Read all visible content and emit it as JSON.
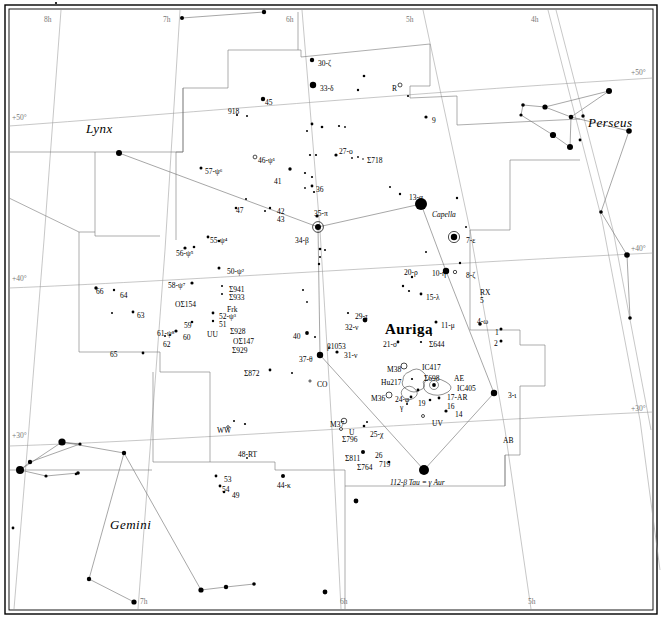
{
  "chart_data": {
    "type": "scatter",
    "xlabel": "Right Ascension",
    "ylabel": "Declination",
    "xlim": [
      "8h",
      "4h"
    ],
    "ylim": [
      "+28",
      "+56"
    ],
    "grid": true,
    "ra_ticks_top": [
      {
        "label": "8h",
        "x": 56
      },
      {
        "label": "7h",
        "x": 175
      },
      {
        "label": "6h",
        "x": 298
      },
      {
        "label": "5h",
        "x": 418
      },
      {
        "label": "4h",
        "x": 543
      }
    ],
    "ra_ticks_bottom": [
      {
        "label": "7h",
        "x": 140
      },
      {
        "label": "6h",
        "x": 340
      },
      {
        "label": "5h",
        "x": 528
      }
    ],
    "dec_ticks_left": [
      {
        "label": "+50°",
        "y": 122
      },
      {
        "label": "+40°",
        "y": 283
      },
      {
        "label": "+30°",
        "y": 440
      }
    ],
    "dec_ticks_right": [
      {
        "label": "+50°",
        "y": 77
      },
      {
        "label": "+40°",
        "y": 253
      },
      {
        "label": "+30°",
        "y": 413
      }
    ],
    "constellations": [
      {
        "name": "Lynx",
        "x": 86,
        "y": 122
      },
      {
        "name": "Perseus",
        "x": 588,
        "y": 116
      },
      {
        "name": "Auriga",
        "x": 385,
        "y": 322
      },
      {
        "name": "Gemini",
        "x": 110,
        "y": 518
      }
    ],
    "star_labels": [
      {
        "t": "30-ζ",
        "x": 318,
        "y": 60
      },
      {
        "t": "33-δ",
        "x": 320,
        "y": 85
      },
      {
        "t": "R",
        "x": 392,
        "y": 85
      },
      {
        "t": "45",
        "x": 265,
        "y": 99
      },
      {
        "t": "918",
        "x": 228,
        "y": 108
      },
      {
        "t": "9",
        "x": 432,
        "y": 117
      },
      {
        "t": "57-ψ⁶",
        "x": 205,
        "y": 168
      },
      {
        "t": "46-ψ¹",
        "x": 258,
        "y": 157
      },
      {
        "t": "27-o",
        "x": 339,
        "y": 148
      },
      {
        "t": "Σ718",
        "x": 367,
        "y": 157
      },
      {
        "t": "41",
        "x": 274,
        "y": 178
      },
      {
        "t": "36",
        "x": 316,
        "y": 186
      },
      {
        "t": "47",
        "x": 236,
        "y": 207
      },
      {
        "t": "42",
        "x": 277,
        "y": 208
      },
      {
        "t": "43",
        "x": 277,
        "y": 216
      },
      {
        "t": "35-π",
        "x": 314,
        "y": 210
      },
      {
        "t": "13-α",
        "x": 409,
        "y": 194
      },
      {
        "t": "Capella",
        "x": 432,
        "y": 211,
        "italic": true
      },
      {
        "t": "55-ψ⁴",
        "x": 210,
        "y": 237
      },
      {
        "t": "34-β",
        "x": 295,
        "y": 237
      },
      {
        "t": "7-ε",
        "x": 466,
        "y": 237
      },
      {
        "t": "56-ψ⁵",
        "x": 176,
        "y": 250
      },
      {
        "t": "50-ψ²",
        "x": 227,
        "y": 268
      },
      {
        "t": "20-ρ",
        "x": 404,
        "y": 269
      },
      {
        "t": "10-η",
        "x": 432,
        "y": 270
      },
      {
        "t": "8-ζ",
        "x": 466,
        "y": 272
      },
      {
        "t": "58-ψ⁷",
        "x": 168,
        "y": 282
      },
      {
        "t": "Σ941",
        "x": 229,
        "y": 286
      },
      {
        "t": "Σ933",
        "x": 229,
        "y": 294
      },
      {
        "t": "OΣ154",
        "x": 175,
        "y": 301
      },
      {
        "t": "Frk",
        "x": 227,
        "y": 306
      },
      {
        "t": "5",
        "x": 480,
        "y": 297
      },
      {
        "t": "RX",
        "x": 480,
        "y": 289
      },
      {
        "t": "15-λ",
        "x": 426,
        "y": 294
      },
      {
        "t": "66",
        "x": 96,
        "y": 288
      },
      {
        "t": "64",
        "x": 120,
        "y": 292
      },
      {
        "t": "52-ψ³",
        "x": 219,
        "y": 313
      },
      {
        "t": "51",
        "x": 219,
        "y": 321
      },
      {
        "t": "63",
        "x": 137,
        "y": 312
      },
      {
        "t": "59",
        "x": 184,
        "y": 322
      },
      {
        "t": "11-μ",
        "x": 441,
        "y": 322
      },
      {
        "t": "4-ω",
        "x": 477,
        "y": 318
      },
      {
        "t": "61-ψ⁸",
        "x": 157,
        "y": 330
      },
      {
        "t": "60",
        "x": 183,
        "y": 334
      },
      {
        "t": "62",
        "x": 163,
        "y": 341
      },
      {
        "t": "UU",
        "x": 207,
        "y": 331
      },
      {
        "t": "Σ928",
        "x": 230,
        "y": 328
      },
      {
        "t": "OΣ147",
        "x": 233,
        "y": 338
      },
      {
        "t": "Σ929",
        "x": 232,
        "y": 347
      },
      {
        "t": "40",
        "x": 293,
        "y": 333
      },
      {
        "t": "1",
        "x": 495,
        "y": 329
      },
      {
        "t": "2",
        "x": 494,
        "y": 340
      },
      {
        "t": "29-τ",
        "x": 355,
        "y": 313
      },
      {
        "t": "32-ν",
        "x": 345,
        "y": 324
      },
      {
        "t": "21-σ",
        "x": 383,
        "y": 341
      },
      {
        "t": "Σ644",
        "x": 429,
        "y": 341
      },
      {
        "t": "β1053",
        "x": 327,
        "y": 343
      },
      {
        "t": "65",
        "x": 110,
        "y": 351
      },
      {
        "t": "31-ν",
        "x": 344,
        "y": 352
      },
      {
        "t": "37-θ",
        "x": 299,
        "y": 356
      },
      {
        "t": "Σ872",
        "x": 244,
        "y": 370
      },
      {
        "t": "CO",
        "x": 317,
        "y": 381
      },
      {
        "t": "M38",
        "x": 387,
        "y": 366
      },
      {
        "t": "IC417",
        "x": 422,
        "y": 364
      },
      {
        "t": "Hu217",
        "x": 381,
        "y": 379
      },
      {
        "t": "Σ698",
        "x": 424,
        "y": 375
      },
      {
        "t": "AE",
        "x": 454,
        "y": 375
      },
      {
        "t": "IC405",
        "x": 457,
        "y": 385
      },
      {
        "t": "M36",
        "x": 371,
        "y": 395
      },
      {
        "t": "24-φ",
        "x": 395,
        "y": 396
      },
      {
        "t": "17-AR",
        "x": 447,
        "y": 394
      },
      {
        "t": "19",
        "x": 418,
        "y": 400
      },
      {
        "t": "16",
        "x": 447,
        "y": 403
      },
      {
        "t": "γ",
        "x": 400,
        "y": 404
      },
      {
        "t": "14",
        "x": 455,
        "y": 411
      },
      {
        "t": "3-ι",
        "x": 508,
        "y": 392
      },
      {
        "t": "UV",
        "x": 432,
        "y": 420
      },
      {
        "t": "M37",
        "x": 330,
        "y": 421
      },
      {
        "t": "WW",
        "x": 217,
        "y": 427
      },
      {
        "t": "U",
        "x": 349,
        "y": 429
      },
      {
        "t": "25-χ",
        "x": 370,
        "y": 431
      },
      {
        "t": "AB",
        "x": 503,
        "y": 437
      },
      {
        "t": "Σ796",
        "x": 342,
        "y": 436
      },
      {
        "t": "48-RT",
        "x": 238,
        "y": 451
      },
      {
        "t": "26",
        "x": 375,
        "y": 452
      },
      {
        "t": "Σ811",
        "x": 345,
        "y": 455
      },
      {
        "t": "719",
        "x": 379,
        "y": 461
      },
      {
        "t": "Σ764",
        "x": 357,
        "y": 464
      },
      {
        "t": "53",
        "x": 224,
        "y": 476
      },
      {
        "t": "54",
        "x": 222,
        "y": 486
      },
      {
        "t": "49",
        "x": 232,
        "y": 492
      },
      {
        "t": "44-κ",
        "x": 277,
        "y": 482
      },
      {
        "t": "112-β Tau = γ Aur",
        "x": 390,
        "y": 479,
        "italic": true
      }
    ],
    "stars": [
      {
        "x": 56,
        "y": 3,
        "r": 1.1
      },
      {
        "x": 182,
        "y": 18,
        "r": 2.0
      },
      {
        "x": 264,
        "y": 12,
        "r": 2.2
      },
      {
        "x": 312,
        "y": 60,
        "r": 2.2
      },
      {
        "x": 313,
        "y": 85,
        "r": 3.2
      },
      {
        "x": 364,
        "y": 76,
        "r": 1.3
      },
      {
        "x": 358,
        "y": 90,
        "r": 1.2
      },
      {
        "x": 400,
        "y": 85,
        "r": 2.0,
        "open": true
      },
      {
        "x": 408,
        "y": 96,
        "r": 1.1
      },
      {
        "x": 263,
        "y": 99,
        "r": 2.2
      },
      {
        "x": 237,
        "y": 115,
        "r": 1.1
      },
      {
        "x": 247,
        "y": 116,
        "r": 1.0
      },
      {
        "x": 426,
        "y": 117,
        "r": 1.6
      },
      {
        "x": 119,
        "y": 153,
        "r": 3.0
      },
      {
        "x": 545,
        "y": 107,
        "r": 2.6
      },
      {
        "x": 523,
        "y": 105,
        "r": 1.8
      },
      {
        "x": 521,
        "y": 115,
        "r": 1.6
      },
      {
        "x": 571,
        "y": 117,
        "r": 2.3
      },
      {
        "x": 583,
        "y": 116,
        "r": 1.7
      },
      {
        "x": 609,
        "y": 91,
        "r": 3.0
      },
      {
        "x": 629,
        "y": 131,
        "r": 2.8
      },
      {
        "x": 553,
        "y": 135,
        "r": 3.1
      },
      {
        "x": 570,
        "y": 147,
        "r": 3.0
      },
      {
        "x": 580,
        "y": 140,
        "r": 1.4
      },
      {
        "x": 601,
        "y": 212,
        "r": 1.8
      },
      {
        "x": 627,
        "y": 255,
        "r": 2.8
      },
      {
        "x": 630,
        "y": 318,
        "r": 1.8
      },
      {
        "x": 312,
        "y": 124,
        "r": 1.4
      },
      {
        "x": 322,
        "y": 127,
        "r": 1.3
      },
      {
        "x": 339,
        "y": 126,
        "r": 1.1
      },
      {
        "x": 345,
        "y": 127,
        "r": 0.9
      },
      {
        "x": 307,
        "y": 131,
        "r": 1.0
      },
      {
        "x": 255,
        "y": 157,
        "r": 1.9,
        "open": true
      },
      {
        "x": 201,
        "y": 168,
        "r": 1.5
      },
      {
        "x": 336,
        "y": 155,
        "r": 1.6
      },
      {
        "x": 352,
        "y": 158,
        "r": 0.9
      },
      {
        "x": 358,
        "y": 157,
        "r": 0.9
      },
      {
        "x": 363,
        "y": 159,
        "r": 0.8
      },
      {
        "x": 290,
        "y": 169,
        "r": 1.7
      },
      {
        "x": 310,
        "y": 155,
        "r": 1.1
      },
      {
        "x": 316,
        "y": 155,
        "r": 1.1
      },
      {
        "x": 305,
        "y": 173,
        "r": 1.1
      },
      {
        "x": 312,
        "y": 177,
        "r": 1.1
      },
      {
        "x": 312,
        "y": 186,
        "r": 1.4
      },
      {
        "x": 305,
        "y": 188,
        "r": 0.9
      },
      {
        "x": 246,
        "y": 199,
        "r": 1.0
      },
      {
        "x": 236,
        "y": 208,
        "r": 1.3
      },
      {
        "x": 270,
        "y": 208,
        "r": 1.2
      },
      {
        "x": 265,
        "y": 211,
        "r": 1.0
      },
      {
        "x": 317,
        "y": 216,
        "r": 1.6
      },
      {
        "x": 314,
        "y": 192,
        "r": 1.1
      },
      {
        "x": 400,
        "y": 194,
        "r": 1.2
      },
      {
        "x": 421,
        "y": 204,
        "r": 6.0
      },
      {
        "x": 390,
        "y": 187,
        "r": 1.0
      },
      {
        "x": 457,
        "y": 198,
        "r": 1.2
      },
      {
        "x": 454,
        "y": 237,
        "r": 3.2,
        "halo": true
      },
      {
        "x": 466,
        "y": 227,
        "r": 1.0
      },
      {
        "x": 318,
        "y": 227,
        "r": 3.0,
        "halo": true
      },
      {
        "x": 208,
        "y": 237,
        "r": 1.4
      },
      {
        "x": 219,
        "y": 241,
        "r": 1.3
      },
      {
        "x": 185,
        "y": 248,
        "r": 1.6
      },
      {
        "x": 194,
        "y": 247,
        "r": 1.3
      },
      {
        "x": 320,
        "y": 249,
        "r": 1.3
      },
      {
        "x": 325,
        "y": 250,
        "r": 1.0
      },
      {
        "x": 320,
        "y": 257,
        "r": 1.0
      },
      {
        "x": 319,
        "y": 264,
        "r": 1.2
      },
      {
        "x": 219,
        "y": 268,
        "r": 1.5
      },
      {
        "x": 426,
        "y": 252,
        "r": 1.0
      },
      {
        "x": 446,
        "y": 271,
        "r": 3.2
      },
      {
        "x": 455,
        "y": 272,
        "r": 1.7,
        "open": true
      },
      {
        "x": 460,
        "y": 263,
        "r": 1.2
      },
      {
        "x": 412,
        "y": 277,
        "r": 1.2
      },
      {
        "x": 403,
        "y": 286,
        "r": 1.2
      },
      {
        "x": 409,
        "y": 291,
        "r": 1.1
      },
      {
        "x": 421,
        "y": 294,
        "r": 1.4
      },
      {
        "x": 192,
        "y": 283,
        "r": 1.6
      },
      {
        "x": 96,
        "y": 288,
        "r": 1.7
      },
      {
        "x": 114,
        "y": 290,
        "r": 1.2
      },
      {
        "x": 222,
        "y": 286,
        "r": 1.0
      },
      {
        "x": 222,
        "y": 294,
        "r": 1.0
      },
      {
        "x": 213,
        "y": 313,
        "r": 1.4
      },
      {
        "x": 213,
        "y": 321,
        "r": 1.2
      },
      {
        "x": 192,
        "y": 322,
        "r": 1.3
      },
      {
        "x": 133,
        "y": 312,
        "r": 1.4
      },
      {
        "x": 112,
        "y": 313,
        "r": 1.0
      },
      {
        "x": 176,
        "y": 331,
        "r": 1.6
      },
      {
        "x": 170,
        "y": 335,
        "r": 1.0
      },
      {
        "x": 165,
        "y": 336,
        "r": 1.0
      },
      {
        "x": 143,
        "y": 353,
        "r": 1.4
      },
      {
        "x": 307,
        "y": 333,
        "r": 1.9
      },
      {
        "x": 315,
        "y": 337,
        "r": 1.0
      },
      {
        "x": 303,
        "y": 290,
        "r": 1.0
      },
      {
        "x": 307,
        "y": 302,
        "r": 0.9
      },
      {
        "x": 436,
        "y": 322,
        "r": 1.5
      },
      {
        "x": 480,
        "y": 324,
        "r": 1.8
      },
      {
        "x": 501,
        "y": 329,
        "r": 1.5
      },
      {
        "x": 501,
        "y": 341,
        "r": 1.5
      },
      {
        "x": 421,
        "y": 342,
        "r": 1.1
      },
      {
        "x": 431,
        "y": 335,
        "r": 1.0
      },
      {
        "x": 398,
        "y": 342,
        "r": 1.4
      },
      {
        "x": 365,
        "y": 320,
        "r": 2.4
      },
      {
        "x": 348,
        "y": 313,
        "r": 1.1
      },
      {
        "x": 337,
        "y": 352,
        "r": 1.6
      },
      {
        "x": 320,
        "y": 355,
        "r": 3.2
      },
      {
        "x": 329,
        "y": 348,
        "r": 0.9
      },
      {
        "x": 270,
        "y": 370,
        "r": 1.4
      },
      {
        "x": 292,
        "y": 373,
        "r": 1.0
      },
      {
        "x": 310,
        "y": 381,
        "r": 1.1,
        "open": true
      },
      {
        "x": 404,
        "y": 366,
        "r": 3.0,
        "open": true
      },
      {
        "x": 412,
        "y": 379,
        "r": 1.1
      },
      {
        "x": 389,
        "y": 395,
        "r": 3.0,
        "open": true
      },
      {
        "x": 411,
        "y": 397,
        "r": 1.4
      },
      {
        "x": 418,
        "y": 390,
        "r": 1.4
      },
      {
        "x": 407,
        "y": 404,
        "r": 1.0
      },
      {
        "x": 434,
        "y": 385,
        "r": 1.9
      },
      {
        "x": 430,
        "y": 400,
        "r": 1.3
      },
      {
        "x": 439,
        "y": 398,
        "r": 1.4
      },
      {
        "x": 446,
        "y": 411,
        "r": 1.6
      },
      {
        "x": 494,
        "y": 393,
        "r": 3.2
      },
      {
        "x": 423,
        "y": 416,
        "r": 1.5,
        "open": true
      },
      {
        "x": 344,
        "y": 421,
        "r": 2.8,
        "open": true
      },
      {
        "x": 341,
        "y": 429,
        "r": 1.5,
        "open": true
      },
      {
        "x": 364,
        "y": 426,
        "r": 1.3
      },
      {
        "x": 367,
        "y": 422,
        "r": 1.0
      },
      {
        "x": 228,
        "y": 427,
        "r": 1.3,
        "open": true
      },
      {
        "x": 234,
        "y": 421,
        "r": 1.0
      },
      {
        "x": 245,
        "y": 424,
        "r": 1.1
      },
      {
        "x": 363,
        "y": 452,
        "r": 2.0
      },
      {
        "x": 389,
        "y": 462,
        "r": 1.3
      },
      {
        "x": 424,
        "y": 470,
        "r": 5.0
      },
      {
        "x": 247,
        "y": 458,
        "r": 0.9
      },
      {
        "x": 216,
        "y": 476,
        "r": 1.4
      },
      {
        "x": 220,
        "y": 486,
        "r": 1.4
      },
      {
        "x": 224,
        "y": 492,
        "r": 1.3
      },
      {
        "x": 283,
        "y": 476,
        "r": 2.0
      },
      {
        "x": 62,
        "y": 442,
        "r": 3.6
      },
      {
        "x": 80,
        "y": 444,
        "r": 1.6
      },
      {
        "x": 30,
        "y": 462,
        "r": 2.2
      },
      {
        "x": 20,
        "y": 470,
        "r": 4.0
      },
      {
        "x": 46,
        "y": 476,
        "r": 1.6
      },
      {
        "x": 78,
        "y": 473,
        "r": 1.8
      },
      {
        "x": 124,
        "y": 453,
        "r": 2.2
      },
      {
        "x": 13,
        "y": 528,
        "r": 1.4
      },
      {
        "x": 89,
        "y": 579,
        "r": 2.2
      },
      {
        "x": 134,
        "y": 602,
        "r": 2.6
      },
      {
        "x": 201,
        "y": 590,
        "r": 2.6
      },
      {
        "x": 226,
        "y": 587,
        "r": 2.2
      },
      {
        "x": 254,
        "y": 584,
        "r": 1.8
      },
      {
        "x": 325,
        "y": 592,
        "r": 2.4
      },
      {
        "x": 356,
        "y": 501,
        "r": 2.4
      },
      {
        "x": 76,
        "y": 474,
        "r": 1.3
      }
    ]
  }
}
